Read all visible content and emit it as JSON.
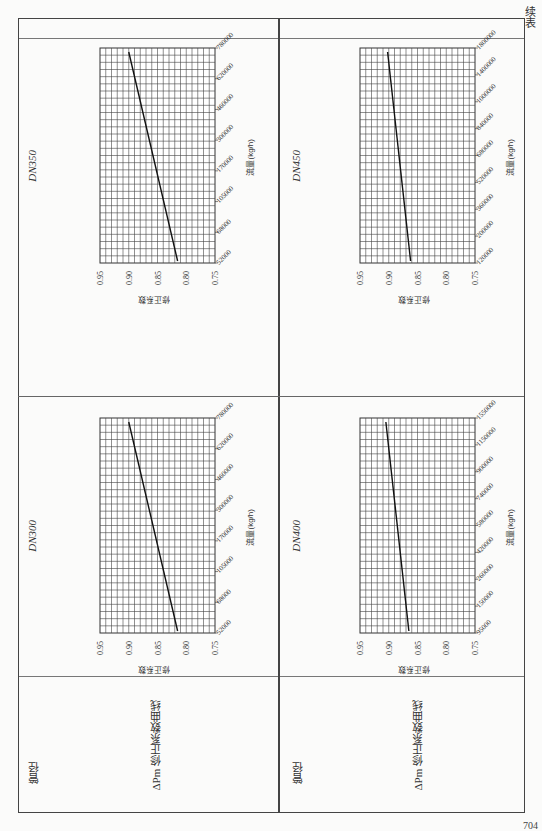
{
  "header": {
    "continued_label": "续表"
  },
  "page_number": "704",
  "table": {
    "row_header_label": "管径",
    "row_curve_label": "ΔPm 修正系数曲线",
    "sections": [
      {
        "pipe_size": "DN300"
      },
      {
        "pipe_size": "DN350"
      },
      {
        "pipe_size": "DN400"
      },
      {
        "pipe_size": "DN450"
      }
    ]
  },
  "chart_data": [
    {
      "type": "line",
      "title": "DN300",
      "xlabel": "流量(kg/h)",
      "ylabel": "修正系数",
      "x_ticks": [
        "52000",
        "68000",
        "105000",
        "170000",
        "300000",
        "460000",
        "620000",
        "780000"
      ],
      "y_ticks": [
        "0.75",
        "0.80",
        "0.85",
        "0.90",
        "0.95"
      ],
      "ylim": [
        0.75,
        0.95
      ],
      "grid": true,
      "series": [
        {
          "name": "修正系数",
          "x": [
            "52000",
            "780000"
          ],
          "values": [
            0.815,
            0.9
          ]
        }
      ]
    },
    {
      "type": "line",
      "title": "DN350",
      "xlabel": "流量(kg/h)",
      "ylabel": "修正系数",
      "x_ticks": [
        "52000",
        "68000",
        "105000",
        "170000",
        "300000",
        "460000",
        "620000",
        "780000"
      ],
      "y_ticks": [
        "0.75",
        "0.80",
        "0.85",
        "0.90",
        "0.95"
      ],
      "ylim": [
        0.75,
        0.95
      ],
      "grid": true,
      "series": [
        {
          "name": "修正系数",
          "x": [
            "52000",
            "780000"
          ],
          "values": [
            0.815,
            0.9
          ]
        }
      ]
    },
    {
      "type": "line",
      "title": "DN400",
      "xlabel": "流量(kg/h)",
      "ylabel": "修正系数",
      "x_ticks": [
        "95000",
        "150000",
        "260000",
        "420000",
        "580000",
        "740000",
        "900000",
        "1150000",
        "1550000"
      ],
      "y_ticks": [
        "0.75",
        "0.80",
        "0.85",
        "0.90",
        "0.95"
      ],
      "ylim": [
        0.75,
        0.95
      ],
      "grid": true,
      "series": [
        {
          "name": "修正系数",
          "x": [
            "95000",
            "1550000"
          ],
          "values": [
            0.865,
            0.905
          ]
        }
      ]
    },
    {
      "type": "line",
      "title": "DN450",
      "xlabel": "流量(kg/h)",
      "ylabel": "修正系数",
      "x_ticks": [
        "120000",
        "200000",
        "360000",
        "520000",
        "680000",
        "840000",
        "1000000",
        "1400000",
        "1800000"
      ],
      "y_ticks": [
        "0.75",
        "0.80",
        "0.85",
        "0.90",
        "0.95"
      ],
      "ylim": [
        0.75,
        0.95
      ],
      "grid": true,
      "series": [
        {
          "name": "修正系数",
          "x": [
            "120000",
            "1800000"
          ],
          "values": [
            0.862,
            0.902
          ]
        }
      ]
    }
  ]
}
